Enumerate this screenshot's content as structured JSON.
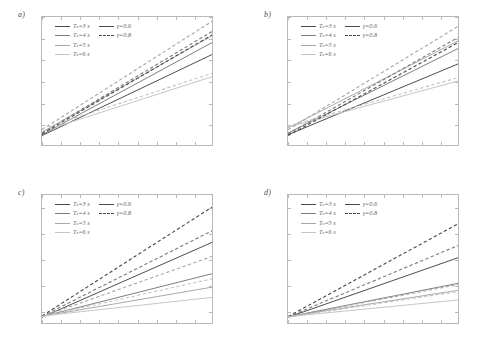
{
  "figure": {
    "panels": [
      {
        "id": "a",
        "label": "a)",
        "xlabel": "q [-]",
        "ylabel": "μ [-]"
      },
      {
        "id": "b",
        "label": "b)",
        "xlabel": "q [-]",
        "ylabel": "μ [-]"
      },
      {
        "id": "c",
        "label": "c)",
        "xlabel": "q [-]",
        "ylabel": "μ [-]"
      },
      {
        "id": "d",
        "label": "d)",
        "xlabel": "q [-]",
        "ylabel": "μ [-]"
      }
    ],
    "legend": {
      "column_left": [
        "Tₛ=3 s",
        "Tₛ=4 s",
        "Tₛ=5 s",
        "Tₛ=6 s"
      ],
      "column_right": [
        "γ=0.6",
        "γ=0.8"
      ]
    },
    "colors": {
      "Ts3": "#4a4a4a",
      "Ts4": "#7d7d7d",
      "Ts5": "#a8a8a8",
      "Ts6": "#c4c4c4",
      "axis": "#b9b9b9",
      "tick_text": "#6d6d6d",
      "label_text": "#5a5a5a"
    }
  },
  "chart_data": [
    {
      "type": "line",
      "panel": "a",
      "title": "a)",
      "xlabel": "q [-]",
      "ylabel": "μ [-]",
      "xlim": [
        1.1,
        2.0
      ],
      "ylim": [
        1.0,
        4.0
      ],
      "xticks": [
        1.1,
        1.2,
        1.3,
        1.4,
        1.5,
        1.6,
        1.7,
        1.8,
        1.9,
        2.0
      ],
      "xticklabels": [
        "1.1",
        "1.2",
        "1.3",
        "1.4",
        "1.5",
        "1.6",
        "1.7",
        "1.8",
        "1.9",
        "2"
      ],
      "yticks": [
        1,
        1.5,
        2,
        2.5,
        3,
        3.5,
        4
      ],
      "yticklabels": [
        "1",
        "1.5",
        "2",
        "2.5",
        "3",
        "3.5",
        "4"
      ],
      "grid": false,
      "legend_position": "upper left",
      "x": [
        1.1,
        2.0
      ],
      "series": [
        {
          "name": "Tₛ=3 s, γ=0.6",
          "Ts": 3,
          "gamma": 0.6,
          "style": "solid",
          "color": "#4a4a4a",
          "values": [
            1.22,
            3.12
          ]
        },
        {
          "name": "Tₛ=4 s, γ=0.6",
          "Ts": 4,
          "gamma": 0.6,
          "style": "solid",
          "color": "#7d7d7d",
          "values": [
            1.24,
            3.4
          ]
        },
        {
          "name": "Tₛ=5 s, γ=0.6",
          "Ts": 5,
          "gamma": 0.6,
          "style": "solid",
          "color": "#a8a8a8",
          "values": [
            1.3,
            3.56
          ]
        },
        {
          "name": "Tₛ=6 s, γ=0.6",
          "Ts": 6,
          "gamma": 0.6,
          "style": "solid",
          "color": "#c4c4c4",
          "values": [
            1.32,
            2.6
          ]
        },
        {
          "name": "Tₛ=3 s, γ=0.8",
          "Ts": 3,
          "gamma": 0.8,
          "style": "dashed",
          "color": "#4a4a4a",
          "values": [
            1.26,
            3.58
          ]
        },
        {
          "name": "Tₛ=4 s, γ=0.8",
          "Ts": 4,
          "gamma": 0.8,
          "style": "dashed",
          "color": "#7d7d7d",
          "values": [
            1.28,
            3.66
          ]
        },
        {
          "name": "Tₛ=5 s, γ=0.8",
          "Ts": 5,
          "gamma": 0.8,
          "style": "dashed",
          "color": "#a8a8a8",
          "values": [
            1.36,
            3.9
          ]
        },
        {
          "name": "Tₛ=6 s, γ=0.8",
          "Ts": 6,
          "gamma": 0.8,
          "style": "dashed",
          "color": "#c4c4c4",
          "values": [
            1.38,
            2.68
          ]
        }
      ]
    },
    {
      "type": "line",
      "panel": "b",
      "title": "b)",
      "xlabel": "q [-]",
      "ylabel": "μ [-]",
      "xlim": [
        1.1,
        2.0
      ],
      "ylim": [
        1.0,
        4.0
      ],
      "xticks": [
        1.1,
        1.2,
        1.3,
        1.4,
        1.5,
        1.6,
        1.7,
        1.8,
        1.9,
        2.0
      ],
      "xticklabels": [
        "1.1",
        "1.2",
        "1.3",
        "1.4",
        "1.5",
        "1.6",
        "1.7",
        "1.8",
        "1.9",
        "2.0"
      ],
      "yticks": [
        1,
        1.5,
        2,
        2.5,
        3,
        3.5,
        4
      ],
      "yticklabels": [
        "1",
        "1.5",
        "2",
        "2.5",
        "3",
        "3.5",
        "4"
      ],
      "grid": false,
      "legend_position": "upper left",
      "x": [
        1.1,
        2.0
      ],
      "series": [
        {
          "name": "Tₛ=3 s, γ=0.6",
          "Ts": 3,
          "gamma": 0.6,
          "style": "solid",
          "color": "#4a4a4a",
          "values": [
            1.24,
            2.9
          ]
        },
        {
          "name": "Tₛ=4 s, γ=0.6",
          "Ts": 4,
          "gamma": 0.6,
          "style": "solid",
          "color": "#7d7d7d",
          "values": [
            1.28,
            3.26
          ]
        },
        {
          "name": "Tₛ=5 s, γ=0.6",
          "Ts": 5,
          "gamma": 0.6,
          "style": "solid",
          "color": "#a8a8a8",
          "values": [
            1.4,
            3.44
          ]
        },
        {
          "name": "Tₛ=6 s, γ=0.6",
          "Ts": 6,
          "gamma": 0.6,
          "style": "solid",
          "color": "#c4c4c4",
          "values": [
            1.42,
            2.5
          ]
        },
        {
          "name": "Tₛ=3 s, γ=0.8",
          "Ts": 3,
          "gamma": 0.8,
          "style": "dashed",
          "color": "#4a4a4a",
          "values": [
            1.22,
            3.4
          ]
        },
        {
          "name": "Tₛ=4 s, γ=0.8",
          "Ts": 4,
          "gamma": 0.8,
          "style": "dashed",
          "color": "#7d7d7d",
          "values": [
            1.26,
            3.52
          ]
        },
        {
          "name": "Tₛ=5 s, γ=0.8",
          "Ts": 5,
          "gamma": 0.8,
          "style": "dashed",
          "color": "#a8a8a8",
          "values": [
            1.36,
            3.78
          ]
        },
        {
          "name": "Tₛ=6 s, γ=0.8",
          "Ts": 6,
          "gamma": 0.8,
          "style": "dashed",
          "color": "#c4c4c4",
          "values": [
            1.44,
            2.58
          ]
        }
      ]
    },
    {
      "type": "line",
      "panel": "c",
      "title": "c)",
      "xlabel": "q [-]",
      "ylabel": "μ [-]",
      "xlim": [
        1.1,
        2.0
      ],
      "ylim": [
        1.0,
        11.0
      ],
      "xticks": [
        1.1,
        1.2,
        1.3,
        1.4,
        1.5,
        1.6,
        1.7,
        1.8,
        1.9,
        2.0
      ],
      "xticklabels": [
        "1.1",
        "1.2",
        "1.3",
        "1.4",
        "1.5",
        "1.6",
        "1.7",
        "1.8",
        "1.9",
        "2.0"
      ],
      "yticks": [
        2,
        4,
        6,
        8,
        10
      ],
      "yticklabels": [
        "2",
        "4",
        "6",
        "8",
        "10"
      ],
      "grid": false,
      "legend_position": "upper left",
      "x": [
        1.1,
        2.0
      ],
      "series": [
        {
          "name": "Tₛ=3 s, γ=0.6",
          "Ts": 3,
          "gamma": 0.6,
          "style": "solid",
          "color": "#4a4a4a",
          "values": [
            1.45,
            7.3
          ]
        },
        {
          "name": "Tₛ=4 s, γ=0.6",
          "Ts": 4,
          "gamma": 0.6,
          "style": "solid",
          "color": "#7d7d7d",
          "values": [
            1.5,
            4.85
          ]
        },
        {
          "name": "Tₛ=5 s, γ=0.6",
          "Ts": 5,
          "gamma": 0.6,
          "style": "solid",
          "color": "#a8a8a8",
          "values": [
            1.52,
            3.8
          ]
        },
        {
          "name": "Tₛ=6 s, γ=0.6",
          "Ts": 6,
          "gamma": 0.6,
          "style": "solid",
          "color": "#c4c4c4",
          "values": [
            1.55,
            3.0
          ]
        },
        {
          "name": "Tₛ=3 s, γ=0.8",
          "Ts": 3,
          "gamma": 0.8,
          "style": "dashed",
          "color": "#4a4a4a",
          "values": [
            1.55,
            10.05
          ]
        },
        {
          "name": "Tₛ=4 s, γ=0.8",
          "Ts": 4,
          "gamma": 0.8,
          "style": "dashed",
          "color": "#7d7d7d",
          "values": [
            1.52,
            8.2
          ]
        },
        {
          "name": "Tₛ=5 s, γ=0.8",
          "Ts": 5,
          "gamma": 0.8,
          "style": "dashed",
          "color": "#a8a8a8",
          "values": [
            1.5,
            6.2
          ]
        },
        {
          "name": "Tₛ=6 s, γ=0.8",
          "Ts": 6,
          "gamma": 0.8,
          "style": "dashed",
          "color": "#c4c4c4",
          "values": [
            1.5,
            4.45
          ]
        }
      ]
    },
    {
      "type": "line",
      "panel": "d",
      "title": "d)",
      "xlabel": "q [-]",
      "ylabel": "μ [-]",
      "xlim": [
        1.1,
        2.0
      ],
      "ylim": [
        1.0,
        11.0
      ],
      "xticks": [
        1.1,
        1.2,
        1.3,
        1.4,
        1.5,
        1.6,
        1.7,
        1.8,
        1.9,
        2.0
      ],
      "xticklabels": [
        "1.1",
        "1.2",
        "1.3",
        "1.4",
        "1.5",
        "1.6",
        "1.7",
        "1.8",
        "1.9",
        "2.0"
      ],
      "yticks": [
        2,
        4,
        6,
        8,
        10
      ],
      "yticklabels": [
        "2",
        "4",
        "6",
        "8",
        "10"
      ],
      "grid": false,
      "legend_position": "upper left",
      "x": [
        1.1,
        2.0
      ],
      "series": [
        {
          "name": "Tₛ=3 s, γ=0.6",
          "Ts": 3,
          "gamma": 0.6,
          "style": "solid",
          "color": "#4a4a4a",
          "values": [
            1.45,
            6.1
          ]
        },
        {
          "name": "Tₛ=4 s, γ=0.6",
          "Ts": 4,
          "gamma": 0.6,
          "style": "solid",
          "color": "#7d7d7d",
          "values": [
            1.48,
            4.1
          ]
        },
        {
          "name": "Tₛ=5 s, γ=0.6",
          "Ts": 5,
          "gamma": 0.6,
          "style": "solid",
          "color": "#a8a8a8",
          "values": [
            1.5,
            3.55
          ]
        },
        {
          "name": "Tₛ=6 s, γ=0.6",
          "Ts": 6,
          "gamma": 0.6,
          "style": "solid",
          "color": "#c4c4c4",
          "values": [
            1.5,
            2.8
          ]
        },
        {
          "name": "Tₛ=3 s, γ=0.8",
          "Ts": 3,
          "gamma": 0.8,
          "style": "dashed",
          "color": "#4a4a4a",
          "values": [
            1.5,
            8.75
          ]
        },
        {
          "name": "Tₛ=4 s, γ=0.8",
          "Ts": 4,
          "gamma": 0.8,
          "style": "dashed",
          "color": "#7d7d7d",
          "values": [
            1.48,
            7.05
          ]
        },
        {
          "name": "Tₛ=5 s, γ=0.8",
          "Ts": 5,
          "gamma": 0.8,
          "style": "dashed",
          "color": "#a8a8a8",
          "values": [
            1.46,
            4.0
          ]
        },
        {
          "name": "Tₛ=6 s, γ=0.8",
          "Ts": 6,
          "gamma": 0.8,
          "style": "dashed",
          "color": "#c4c4c4",
          "values": [
            1.46,
            3.45
          ]
        }
      ]
    }
  ]
}
